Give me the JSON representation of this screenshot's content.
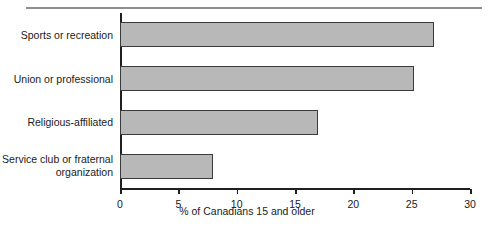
{
  "chart_data": {
    "type": "bar",
    "orientation": "horizontal",
    "title": "",
    "subtitle": "",
    "xlabel": "% of Canadians 15 and older",
    "ylabel": "",
    "categories": [
      "Sports or recreation",
      "Union or professional",
      "Religious-affiliated",
      "Service club or fraternal\norganization"
    ],
    "values": [
      26.9,
      25.2,
      17.0,
      8.0
    ],
    "xlim": [
      0,
      30
    ],
    "xticks": [
      0,
      5,
      10,
      15,
      20,
      25,
      30
    ],
    "xtick_labels": [
      "0",
      "5",
      "10",
      "15",
      "20",
      "25",
      "30"
    ],
    "grid": false,
    "legend": null,
    "bar_fill_color": "#b8b8b8",
    "bar_edge_color": "#3a3a3a",
    "axis_color": "#1f1f1f",
    "background_color": "#ffffff",
    "rule_color": "#8e8e8e"
  }
}
